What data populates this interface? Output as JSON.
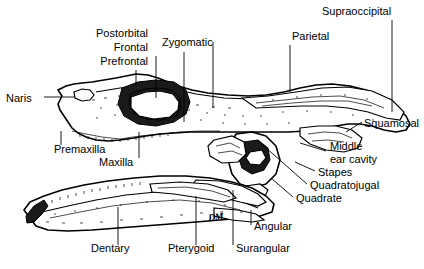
{
  "figure": {
    "view": "lateral",
    "artist_signature": "DM.",
    "ink_color": "#000000",
    "background_color": "#ffffff"
  },
  "labels": [
    {
      "id": "postorbital",
      "text": "Postorbital",
      "x": 148,
      "y": 36,
      "align": "right"
    },
    {
      "id": "frontal",
      "text": "Frontal",
      "x": 148,
      "y": 50,
      "align": "right"
    },
    {
      "id": "prefrontal",
      "text": "Prefrontal",
      "x": 148,
      "y": 64,
      "align": "right"
    },
    {
      "id": "zygomatic",
      "text": "Zygomatic",
      "x": 168,
      "y": 45,
      "align": "left"
    },
    {
      "id": "parietal",
      "text": "Parietal",
      "x": 294,
      "y": 39,
      "align": "left"
    },
    {
      "id": "supraoccipital",
      "text": "Supraoccipital",
      "x": 325,
      "y": 14,
      "align": "left"
    },
    {
      "id": "naris",
      "text": "Naris",
      "x": 8,
      "y": 101,
      "align": "left"
    },
    {
      "id": "squamosal",
      "text": "Squamosal",
      "x": 364,
      "y": 126,
      "align": "left"
    },
    {
      "id": "premaxilla",
      "text": "Premaxilla",
      "x": 56,
      "y": 152,
      "align": "left"
    },
    {
      "id": "maxilla",
      "text": "Maxilla",
      "x": 101,
      "y": 165,
      "align": "left"
    },
    {
      "id": "middle-ear-1",
      "text": "Middle",
      "x": 330,
      "y": 149,
      "align": "left"
    },
    {
      "id": "middle-ear-2",
      "text": "ear cavity",
      "x": 330,
      "y": 162,
      "align": "left"
    },
    {
      "id": "stapes",
      "text": "Stapes",
      "x": 318,
      "y": 175,
      "align": "left"
    },
    {
      "id": "quadratojugal",
      "text": "Quadratojugal",
      "x": 310,
      "y": 188,
      "align": "left"
    },
    {
      "id": "quadrate",
      "text": "Quadrate",
      "x": 296,
      "y": 201,
      "align": "left"
    },
    {
      "id": "angular",
      "text": "Angular",
      "x": 254,
      "y": 229,
      "align": "left"
    },
    {
      "id": "dentary",
      "text": "Dentary",
      "x": 93,
      "y": 251,
      "align": "left"
    },
    {
      "id": "pterygoid",
      "text": "Pterygoid",
      "x": 170,
      "y": 251,
      "align": "left"
    },
    {
      "id": "surangular",
      "text": "Surangular",
      "x": 238,
      "y": 251,
      "align": "left"
    }
  ],
  "leaders": [
    {
      "id": "postorbital-leader",
      "points": "213,42 213,108"
    },
    {
      "id": "frontal-leader",
      "points": "156,56 156,98"
    },
    {
      "id": "prefrontal-leader",
      "points": "136,70 136,86"
    },
    {
      "id": "zygomatic-leader",
      "points": "184,52 184,122"
    },
    {
      "id": "parietal-leader",
      "points": "290,45 290,92"
    },
    {
      "id": "supraoccipital-leader",
      "points": "392,20 392,112"
    },
    {
      "id": "naris-leader",
      "points": "44,97 74,97"
    },
    {
      "id": "squamosal-leader",
      "points": "362,122 346,132"
    },
    {
      "id": "premaxilla-leader",
      "points": "61,145 61,131"
    },
    {
      "id": "maxilla-leader",
      "points": "139,158 139,132"
    },
    {
      "id": "middle-ear-leader",
      "points": "326,151 300,143"
    },
    {
      "id": "stapes-leader",
      "points": "315,171 295,162"
    },
    {
      "id": "quadratojugal-leader",
      "points": "307,184 257,140"
    },
    {
      "id": "quadrate-leader",
      "points": "293,197 271,178"
    },
    {
      "id": "angular-leader",
      "points": "251,225 251,210"
    },
    {
      "id": "dentary-leader",
      "points": "118,245 118,207"
    },
    {
      "id": "pterygoid-leader",
      "points": "196,245 196,196"
    },
    {
      "id": "surangular-leader",
      "points": "233,245 233,190"
    }
  ]
}
